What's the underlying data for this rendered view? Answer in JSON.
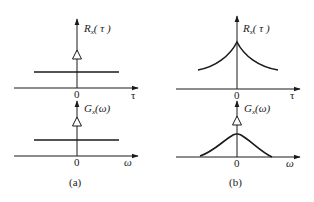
{
  "figure": {
    "panel_a": {
      "caption": "(a)",
      "top": {
        "func_letter": "R",
        "func_sub": "x",
        "func_arg": "( τ )",
        "origin_label": "0",
        "axis_label": "τ",
        "shape": "constant + impulse at 0"
      },
      "bottom": {
        "func_letter": "G",
        "func_sub": "x",
        "func_arg": "(ω)",
        "origin_label": "0",
        "axis_label": "ω",
        "shape": "constant + impulse at 0"
      }
    },
    "panel_b": {
      "caption": "(b)",
      "top": {
        "func_letter": "R",
        "func_sub": "x",
        "func_arg": "( τ )",
        "origin_label": "0",
        "axis_label": "τ",
        "shape": "two-sided exponential decay (cusp at 0)"
      },
      "bottom": {
        "func_letter": "G",
        "func_sub": "x",
        "func_arg": "(ω)",
        "origin_label": "0",
        "axis_label": "ω",
        "shape": "bell curve + impulse at 0"
      }
    }
  }
}
